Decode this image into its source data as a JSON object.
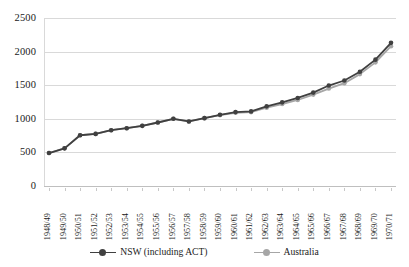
{
  "chart_data": {
    "type": "line",
    "title": "",
    "xlabel": "",
    "ylabel": "",
    "ylim": [
      0,
      2500
    ],
    "ytick_step": 500,
    "yticks": [
      "0",
      "500",
      "1000",
      "1500",
      "2000",
      "2500"
    ],
    "grid": true,
    "legend_position": "bottom",
    "categories": [
      "1948/49",
      "1949/50",
      "1950/51",
      "1951/52",
      "1952/53",
      "1953/54",
      "1954/55",
      "1955/56",
      "1956/57",
      "1957/58",
      "1958/59",
      "1959/60",
      "1960/61",
      "1961/62",
      "1962/63",
      "1963/64",
      "1964/65",
      "1965/66",
      "1966/67",
      "1967/68",
      "1968/69",
      "1969/70",
      "1970/71"
    ],
    "series": [
      {
        "name": "NSW (including ACT)",
        "color": "#404040",
        "marker": "circle",
        "values": [
          490,
          560,
          755,
          775,
          830,
          860,
          895,
          945,
          1000,
          960,
          1010,
          1060,
          1100,
          1110,
          1185,
          1245,
          1310,
          1390,
          1495,
          1570,
          1700,
          1880,
          2130
        ]
      },
      {
        "name": "Australia",
        "color": "#a6a6a6",
        "marker": "circle",
        "values": [
          490,
          560,
          755,
          775,
          830,
          860,
          895,
          945,
          1000,
          960,
          1010,
          1055,
          1090,
          1100,
          1165,
          1220,
          1280,
          1360,
          1450,
          1530,
          1665,
          1840,
          2080
        ]
      }
    ]
  },
  "legend": {
    "items": [
      {
        "label": "NSW (including ACT)",
        "color": "#404040"
      },
      {
        "label": "Australia",
        "color": "#a6a6a6"
      }
    ]
  },
  "colors": {
    "nsw": "#404040",
    "australia": "#a6a6a6",
    "gridline": "#d9d9d9",
    "text": "#1a1a1a",
    "background": "#ffffff"
  }
}
